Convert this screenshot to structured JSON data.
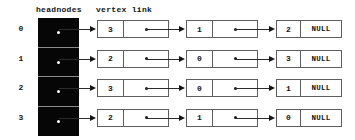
{
  "diagram": {
    "headers": {
      "headnodes": "headnodes",
      "vertex_link": "vertex link"
    },
    "null_label": "NULL",
    "colors": {
      "headnode_fill": "#060606",
      "node_border": "#5d5d5d",
      "connector": "#2b2b2b",
      "text": "#141414",
      "background": "#ffffff"
    },
    "rows": [
      {
        "index": "0",
        "nodes": [
          {
            "vertex": "3",
            "link": "pointer"
          },
          {
            "vertex": "1",
            "link": "pointer"
          },
          {
            "vertex": "2",
            "link": "NULL"
          }
        ]
      },
      {
        "index": "1",
        "nodes": [
          {
            "vertex": "2",
            "link": "pointer"
          },
          {
            "vertex": "0",
            "link": "pointer"
          },
          {
            "vertex": "3",
            "link": "NULL"
          }
        ]
      },
      {
        "index": "2",
        "nodes": [
          {
            "vertex": "3",
            "link": "pointer"
          },
          {
            "vertex": "0",
            "link": "pointer"
          },
          {
            "vertex": "1",
            "link": "NULL"
          }
        ]
      },
      {
        "index": "3",
        "nodes": [
          {
            "vertex": "2",
            "link": "pointer"
          },
          {
            "vertex": "1",
            "link": "pointer"
          },
          {
            "vertex": "0",
            "link": "NULL"
          }
        ]
      }
    ]
  }
}
